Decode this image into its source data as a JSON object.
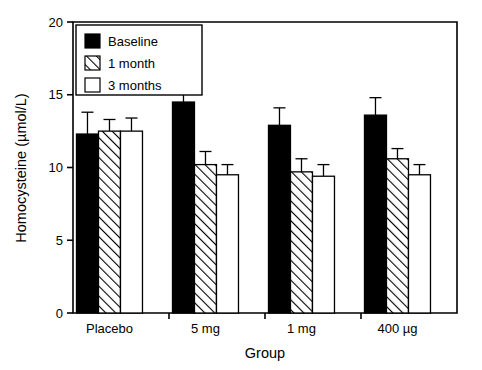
{
  "chart_data": {
    "type": "bar",
    "title": "",
    "xlabel": "Group",
    "ylabel": "Homocysteine (µmol/L)",
    "categories": [
      "Placebo",
      "5 mg",
      "1 mg",
      "400 µg"
    ],
    "ylim": [
      0,
      20
    ],
    "yticks": [
      0,
      5,
      10,
      15,
      20
    ],
    "ytick_labels": [
      "0",
      "5",
      "10",
      "15",
      "20"
    ],
    "grid": false,
    "legend_position": "top-left",
    "series": [
      {
        "name": "Baseline",
        "fill": "solid-black",
        "color": "#000000",
        "values": [
          12.3,
          14.5,
          12.9,
          13.6
        ],
        "errors": [
          1.5,
          1.3,
          1.2,
          1.2
        ]
      },
      {
        "name": "1 month",
        "fill": "diagonal-hatch",
        "color": "#ffffff",
        "values": [
          12.5,
          10.2,
          9.7,
          10.6
        ],
        "errors": [
          0.8,
          0.9,
          0.9,
          0.7
        ]
      },
      {
        "name": "3 months",
        "fill": "open-white",
        "color": "#ffffff",
        "values": [
          12.5,
          9.5,
          9.4,
          9.5
        ],
        "errors": [
          0.9,
          0.7,
          0.8,
          0.7
        ]
      }
    ]
  },
  "legend": {
    "items": [
      {
        "label": "Baseline"
      },
      {
        "label": "1 month"
      },
      {
        "label": "3 months"
      }
    ]
  },
  "axes": {
    "y_title": "Homocysteine (µmol/L)",
    "x_title": "Group"
  }
}
